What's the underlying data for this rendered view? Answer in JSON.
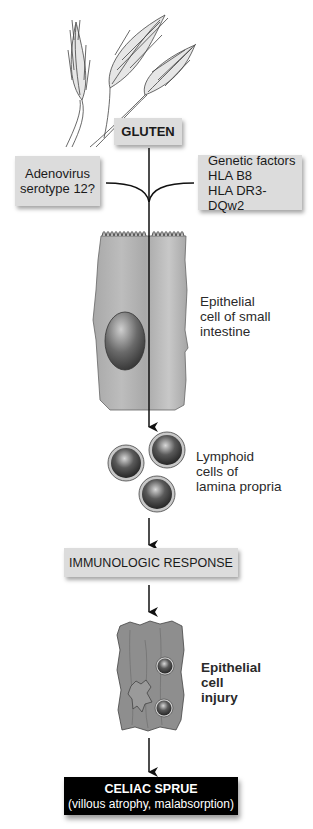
{
  "diagram": {
    "nodes": {
      "gluten": {
        "label": "GLUTEN"
      },
      "adenovirus": {
        "line1": "Adenovirus",
        "line2": "serotype 12?"
      },
      "genetic": {
        "line1": "Genetic factors",
        "line2": "HLA B8",
        "line3": "HLA DR3-DQw2"
      },
      "epithelial_cell": {
        "line1": "Epithelial",
        "line2": "cell of small",
        "line3": "intestine"
      },
      "lymphoid_cells": {
        "line1": "Lymphoid",
        "line2": "cells of",
        "line3": "lamina propria"
      },
      "immunologic": {
        "label": "IMMUNOLOGIC RESPONSE"
      },
      "injury": {
        "line1": "Epithelial",
        "line2": "cell",
        "line3": "injury"
      },
      "celiac": {
        "title": "CELIAC SPRUE",
        "subtitle": "(villous atrophy, malabsorption)"
      }
    },
    "icons": [
      "wheat-illustration",
      "epithelial-cell-illustration",
      "lymphoid-cells-illustration",
      "injured-cell-illustration"
    ],
    "colors": {
      "box_fill": "#dcdcdc",
      "final_box_fill": "#000000",
      "cell_fill": "#b4b4b4",
      "line": "#111111"
    }
  }
}
